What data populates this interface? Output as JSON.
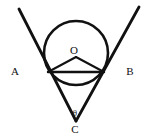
{
  "figure": {
    "background_color": "#ffffff",
    "stroke_color": "#111111",
    "canvas": {
      "width": 148,
      "height": 139
    }
  },
  "labels": {
    "a": {
      "text": "A",
      "x": 15,
      "y": 71
    },
    "b": {
      "text": "B",
      "x": 130,
      "y": 71
    },
    "o": {
      "text": "O",
      "x": 74,
      "y": 50
    },
    "c": {
      "text": "C",
      "x": 75,
      "y": 129
    },
    "theta": {
      "text": "θ",
      "x": 75,
      "y": 113
    }
  },
  "geometry": {
    "circle": {
      "name": "inscribed-circle",
      "center_x": 76,
      "center_y": 53,
      "radius": 32,
      "stroke_width": 2.6
    },
    "apex": {
      "name": "vertex-c",
      "x": 76,
      "y": 121
    },
    "tangent_point_left": {
      "name": "tangent-point-left",
      "x": 48,
      "y": 72
    },
    "tangent_point_right": {
      "name": "tangent-point-right",
      "x": 104,
      "y": 72
    },
    "ray_left_end": {
      "name": "ray-a-endpoint",
      "x": 19,
      "y": 9
    },
    "ray_right_end": {
      "name": "ray-b-endpoint",
      "x": 139,
      "y": 7
    },
    "chord": {
      "name": "tangent-chord",
      "x1": 48,
      "y1": 72,
      "x2": 104,
      "y2": 72,
      "stroke_width": 2.4
    },
    "radius_left": {
      "name": "radius-to-left-tangent",
      "x1": 76,
      "y1": 57,
      "x2": 48,
      "y2": 72,
      "stroke_width": 2.0
    },
    "radius_right": {
      "name": "radius-to-right-tangent",
      "x1": 76,
      "y1": 57,
      "x2": 104,
      "y2": 72,
      "stroke_width": 2.0
    },
    "ray_left": {
      "name": "tangent-ray-ca",
      "x1": 76,
      "y1": 121,
      "x2": 19,
      "y2": 9,
      "stroke_width": 2.8
    },
    "ray_right": {
      "name": "tangent-ray-cb",
      "x1": 76,
      "y1": 121,
      "x2": 139,
      "y2": 7,
      "stroke_width": 2.8
    }
  }
}
